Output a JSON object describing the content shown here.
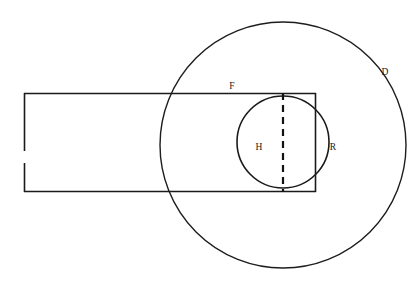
{
  "diagram": {
    "background_color": "#ffffff",
    "stroke_color": "#1a1a1a",
    "canvas": {
      "width": 420,
      "height": 285
    },
    "labels": [
      {
        "id": "F",
        "text": "F",
        "x": 232,
        "y": 89,
        "refers_to": "rectangle-top-edge"
      },
      {
        "id": "D",
        "text": "D",
        "x": 385,
        "y": 75,
        "refers_to": "large-circle"
      },
      {
        "id": "H",
        "text": "H",
        "x": 259,
        "y": 150,
        "refers_to": "dashed-vertical-line"
      },
      {
        "id": "R",
        "text": "R",
        "x": 333,
        "y": 150,
        "refers_to": "small-circle"
      }
    ],
    "shapes": {
      "large_circle": {
        "name": "D",
        "type": "circle",
        "cx": 283,
        "cy": 145,
        "r": 123
      },
      "small_circle": {
        "name": "R",
        "type": "circle",
        "cx": 283,
        "cy": 142,
        "r": 46
      },
      "rectangle": {
        "name": "F",
        "type": "rectangle-with-gap",
        "left": 24,
        "right": 316,
        "top": 93,
        "bottom": 192,
        "left_edge_gap_top": 150,
        "left_edge_gap_bottom": 163
      },
      "dashed_line": {
        "name": "H",
        "type": "vertical-dashed-line",
        "x": 283,
        "y1": 93,
        "y2": 192
      }
    }
  }
}
